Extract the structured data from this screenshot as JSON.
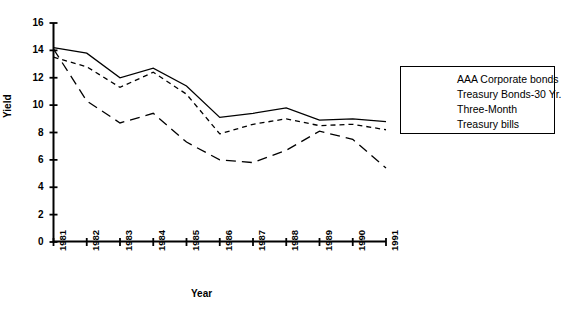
{
  "chart_data": {
    "type": "line",
    "title": "",
    "xlabel": "Year",
    "ylabel": "Yield",
    "x": [
      1981,
      1982,
      1983,
      1984,
      1985,
      1986,
      1987,
      1988,
      1989,
      1990,
      1991
    ],
    "xtick_labels": [
      "1981",
      "1982",
      "1983",
      "1984",
      "1985",
      "1986",
      "1987",
      "1988",
      "1989",
      "1990",
      "1991"
    ],
    "ytick_labels": [
      "0",
      "2",
      "4",
      "6",
      "8",
      "10",
      "12",
      "14",
      "16"
    ],
    "yticks": [
      0,
      2,
      4,
      6,
      8,
      10,
      12,
      14,
      16
    ],
    "ylim": [
      0,
      16
    ],
    "xlim": [
      1981,
      1991
    ],
    "grid": false,
    "legend_position": "right",
    "series": [
      {
        "name": "AAA Corporate bonds",
        "style": "solid",
        "values": [
          14.2,
          13.8,
          12.0,
          12.7,
          11.4,
          9.1,
          9.4,
          9.8,
          8.9,
          9.0,
          8.8
        ]
      },
      {
        "name": "Treasury Bonds-30 Yr.",
        "style": "short-dash",
        "values": [
          13.5,
          12.8,
          11.3,
          12.4,
          10.8,
          7.9,
          8.6,
          9.0,
          8.5,
          8.6,
          8.2
        ]
      },
      {
        "name": "Three-Month Treasury bills",
        "style": "long-dash",
        "values": [
          14.1,
          10.3,
          8.7,
          9.4,
          7.3,
          6.0,
          5.8,
          6.7,
          8.1,
          7.5,
          5.4
        ]
      }
    ]
  },
  "legend": {
    "entries": [
      {
        "label": "AAA Corporate bonds",
        "label2": ""
      },
      {
        "label": "Treasury Bonds-30 Yr.",
        "label2": ""
      },
      {
        "label": "Three-Month",
        "label2": "Treasury bills"
      }
    ]
  },
  "axes": {
    "x_title": "Year",
    "y_title": "Yield"
  }
}
